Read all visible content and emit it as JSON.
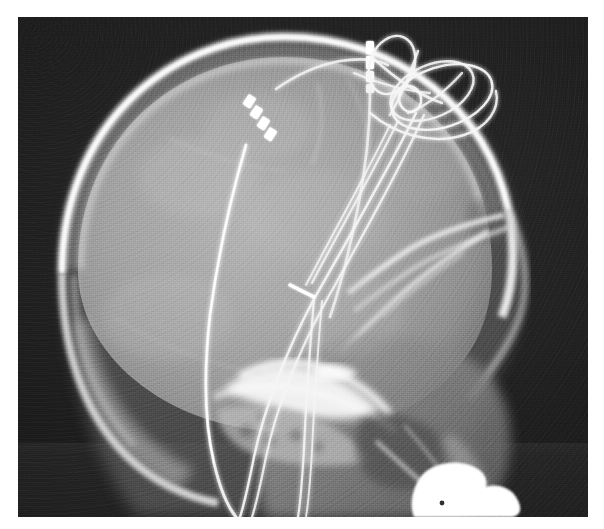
{
  "image": {
    "title": "Lateral skull radiograph",
    "modality": "X-ray",
    "projection": "lateral",
    "region": "skull / cranium",
    "background_color": "#1c1c1c",
    "film_border_color": "#ffffff",
    "bone_color": "#e8e8e8",
    "soft_tissue_color": "#9a9a9a",
    "metal_hardware_color": "#ffffff",
    "width": 604,
    "height": 529
  },
  "film": {
    "margin_left": 18,
    "margin_top": 17,
    "margin_right": 16,
    "margin_bottom": 12,
    "collimation_band_y": 443
  },
  "anatomy": {
    "structures": [
      {
        "name": "calvarium-outer-table",
        "label": "Outer table of skull vault",
        "density": "bone"
      },
      {
        "name": "calvarium-inner-table",
        "label": "Inner table of skull vault",
        "density": "bone"
      },
      {
        "name": "diploe",
        "label": "Diploic space",
        "density": "intermediate"
      },
      {
        "name": "cranial-vault-contents",
        "label": "Cranial vault / brain parenchyma",
        "density": "soft-tissue"
      },
      {
        "name": "frontal-sinus",
        "label": "Frontal sinus",
        "density": "air"
      },
      {
        "name": "orbital-roof",
        "label": "Orbital roof",
        "density": "bone"
      },
      {
        "name": "sphenoid-ridge",
        "label": "Greater wing of sphenoid",
        "density": "bone"
      },
      {
        "name": "sella-turcica",
        "label": "Sella turcica",
        "density": "bone"
      },
      {
        "name": "petrous-temporal-bone",
        "label": "Petrous temporal bone",
        "density": "dense-bone"
      },
      {
        "name": "mastoid-air-cells",
        "label": "Mastoid air cells",
        "density": "mixed"
      },
      {
        "name": "facial-skeleton",
        "label": "Facial skeleton / maxilla",
        "density": "mixed"
      },
      {
        "name": "mandible-ramus",
        "label": "Mandibular ramus",
        "density": "bone"
      },
      {
        "name": "cervical-spine",
        "label": "Upper cervical spine",
        "density": "bone"
      },
      {
        "name": "dental-radiopacity",
        "label": "Dense radiopaque structure (bottom right)",
        "density": "very-dense"
      }
    ]
  },
  "hardware": {
    "description": "Implanted intracranial electrode leads with extracranial strain-relief loops",
    "items": [
      {
        "name": "lead-anterior",
        "label": "Anterior depth electrode lead",
        "contacts": 4,
        "contact_note": "Four radiopaque contacts at distal tip",
        "entry": "parietal burr hole"
      },
      {
        "name": "lead-posterior",
        "label": "Posterior depth electrode lead",
        "contacts": 4,
        "contact_note": "Segmented radiopaque contacts near vertex",
        "entry": "vertex burr hole"
      },
      {
        "name": "strain-relief-coils",
        "label": "Subgaleal strain-relief wire loops",
        "loop_count": 4
      },
      {
        "name": "connector-wires",
        "label": "Extension wires coursing inferiorly to connector",
        "wire_count": 4
      }
    ]
  },
  "annotations": {
    "visible_text": []
  }
}
